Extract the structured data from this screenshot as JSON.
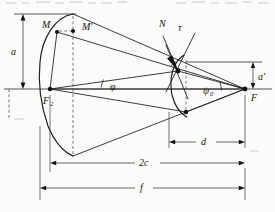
{
  "figure": {
    "kind": "geometry-diagram",
    "background_color": "#fbfbfa",
    "ink_color": "#1a1a1a",
    "gray_guide_color": "#8d8d8d",
    "labels": {
      "point_M": "M",
      "point_M_prime": "M′",
      "focus_left": "F",
      "focus_left_sub": "2",
      "focus_right": "F",
      "normal": "N",
      "tangent": "τ",
      "angle_phi": "φ",
      "angle_psi": "ψ",
      "angle_psi_sub": "0",
      "dim_a": "a",
      "dim_a_prime": "a′",
      "dim_d": "d",
      "dim_2c": "2c",
      "dim_f": "f"
    },
    "dimensions": [
      {
        "name": "a",
        "label": "a",
        "orientation": "vertical",
        "side": "left"
      },
      {
        "name": "a'",
        "label": "a′",
        "orientation": "vertical",
        "side": "right"
      },
      {
        "name": "d",
        "label": "d",
        "orientation": "horizontal",
        "row": 1
      },
      {
        "name": "2c",
        "label": "2c",
        "orientation": "horizontal",
        "row": 2
      },
      {
        "name": "f",
        "label": "f",
        "orientation": "horizontal",
        "row": 3
      }
    ],
    "points": [
      {
        "name": "M",
        "label": "M",
        "x": 57,
        "y": 32
      },
      {
        "name": "M'",
        "label": "M′",
        "x": 75,
        "y": 31
      },
      {
        "name": "F2",
        "label": "F₂",
        "x": 50,
        "y": 89
      },
      {
        "name": "P",
        "label": "",
        "x": 178,
        "y": 71
      },
      {
        "name": "Q",
        "label": "",
        "x": 186,
        "y": 112
      },
      {
        "name": "F",
        "label": "F",
        "x": 245,
        "y": 89
      }
    ]
  }
}
